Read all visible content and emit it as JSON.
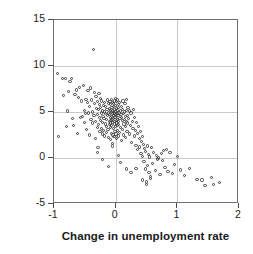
{
  "chart_data": {
    "type": "scatter",
    "title": "",
    "xlabel": "Change in unemployment rate",
    "ylabel": "GDP growth rate",
    "xlim": [
      -1,
      2
    ],
    "ylim": [
      -5,
      15
    ],
    "xticks": [
      -1,
      0,
      1,
      2
    ],
    "yticks": [
      -5,
      0,
      5,
      10,
      15
    ],
    "xticklabels": [
      "-1",
      "0",
      "1",
      "2"
    ],
    "yticklabels": [
      "-5",
      "0",
      "5",
      "10",
      "15"
    ],
    "grid": true,
    "legend": null,
    "marker": "open-circle",
    "marker_color": "#3a3a3a",
    "grid_color": "#c9c9c9",
    "frame_color": "#6e6e6e",
    "series": [
      {
        "name": "countries",
        "points": [
          [
            -0.94,
            9.2
          ],
          [
            -0.93,
            2.3
          ],
          [
            -0.86,
            8.6
          ],
          [
            -0.84,
            6.8
          ],
          [
            -0.82,
            8.6
          ],
          [
            -0.8,
            3.4
          ],
          [
            -0.78,
            5.1
          ],
          [
            -0.76,
            7.2
          ],
          [
            -0.74,
            8.3
          ],
          [
            -0.72,
            8.6
          ],
          [
            -0.7,
            4.3
          ],
          [
            -0.68,
            3.5
          ],
          [
            -0.66,
            6.9
          ],
          [
            -0.64,
            7.4
          ],
          [
            -0.62,
            2.7
          ],
          [
            -0.6,
            6.6
          ],
          [
            -0.58,
            7.7
          ],
          [
            -0.57,
            4.4
          ],
          [
            -0.56,
            6.2
          ],
          [
            -0.54,
            4.5
          ],
          [
            -0.52,
            7.9
          ],
          [
            -0.51,
            3.9
          ],
          [
            -0.5,
            5.2
          ],
          [
            -0.49,
            4.8
          ],
          [
            -0.48,
            6.4
          ],
          [
            -0.47,
            3.1
          ],
          [
            -0.46,
            6.0
          ],
          [
            -0.45,
            7.3
          ],
          [
            -0.44,
            4.9
          ],
          [
            -0.43,
            5.6
          ],
          [
            -0.42,
            2.5
          ],
          [
            -0.41,
            7.6
          ],
          [
            -0.4,
            4.2
          ],
          [
            -0.39,
            6.3
          ],
          [
            -0.38,
            5.0
          ],
          [
            -0.37,
            3.8
          ],
          [
            -0.36,
            11.8
          ],
          [
            -0.35,
            4.6
          ],
          [
            -0.345,
            7.1
          ],
          [
            -0.34,
            5.9
          ],
          [
            -0.33,
            2.1
          ],
          [
            -0.325,
            4.0
          ],
          [
            -0.32,
            6.7
          ],
          [
            -0.31,
            5.4
          ],
          [
            -0.3,
            3.3
          ],
          [
            -0.295,
            4.7
          ],
          [
            -0.29,
            6.1
          ],
          [
            -0.285,
            1.1
          ],
          [
            -0.28,
            5.3
          ],
          [
            -0.275,
            3.6
          ],
          [
            -0.27,
            7.0
          ],
          [
            -0.265,
            4.4
          ],
          [
            -0.26,
            5.8
          ],
          [
            -0.255,
            2.9
          ],
          [
            -0.25,
            6.5
          ],
          [
            -0.245,
            4.1
          ],
          [
            -0.24,
            5.5
          ],
          [
            -0.235,
            3.2
          ],
          [
            -0.23,
            4.9
          ],
          [
            -0.225,
            6.2
          ],
          [
            -0.22,
            2.6
          ],
          [
            -0.215,
            5.1
          ],
          [
            -0.21,
            3.9
          ],
          [
            -0.205,
            4.5
          ],
          [
            -0.2,
            5.7
          ],
          [
            -0.195,
            3.0
          ],
          [
            -0.19,
            4.3
          ],
          [
            -0.185,
            6.0
          ],
          [
            -0.18,
            2.4
          ],
          [
            -0.175,
            5.0
          ],
          [
            -0.17,
            3.7
          ],
          [
            -0.165,
            4.8
          ],
          [
            -0.16,
            5.6
          ],
          [
            -0.155,
            2.8
          ],
          [
            -0.15,
            4.2
          ],
          [
            -0.145,
            3.4
          ],
          [
            -0.14,
            5.3
          ],
          [
            -0.135,
            4.6
          ],
          [
            -0.13,
            6.3
          ],
          [
            -0.125,
            3.1
          ],
          [
            -0.12,
            4.9
          ],
          [
            -0.115,
            5.9
          ],
          [
            -0.11,
            2.2
          ],
          [
            -0.105,
            4.0
          ],
          [
            -0.1,
            5.4
          ],
          [
            -0.098,
            3.6
          ],
          [
            -0.095,
            4.7
          ],
          [
            -0.092,
            6.1
          ],
          [
            -0.09,
            2.0
          ],
          [
            -0.088,
            5.2
          ],
          [
            -0.085,
            3.8
          ],
          [
            -0.082,
            4.4
          ],
          [
            -0.08,
            5.8
          ],
          [
            -0.078,
            3.3
          ],
          [
            -0.075,
            4.1
          ],
          [
            -0.072,
            5.0
          ],
          [
            -0.07,
            6.4
          ],
          [
            -0.068,
            2.7
          ],
          [
            -0.065,
            4.5
          ],
          [
            -0.062,
            3.5
          ],
          [
            -0.06,
            5.5
          ],
          [
            -0.058,
            4.2
          ],
          [
            -0.055,
            1.6
          ],
          [
            -0.052,
            4.8
          ],
          [
            -0.05,
            3.9
          ],
          [
            -0.048,
            5.1
          ],
          [
            -0.045,
            6.0
          ],
          [
            -0.042,
            2.5
          ],
          [
            -0.04,
            4.3
          ],
          [
            -0.038,
            5.6
          ],
          [
            -0.035,
            3.2
          ],
          [
            -0.032,
            4.6
          ],
          [
            -0.03,
            5.9
          ],
          [
            -0.028,
            2.3
          ],
          [
            -0.025,
            4.0
          ],
          [
            -0.022,
            5.3
          ],
          [
            -0.02,
            3.7
          ],
          [
            -0.018,
            4.9
          ],
          [
            -0.015,
            6.2
          ],
          [
            -0.012,
            2.9
          ],
          [
            -0.01,
            4.4
          ],
          [
            -0.008,
            5.7
          ],
          [
            -0.005,
            3.4
          ],
          [
            -0.002,
            4.7
          ],
          [
            0.0,
            5.0
          ],
          [
            0.002,
            6.5
          ],
          [
            0.005,
            2.6
          ],
          [
            0.008,
            4.1
          ],
          [
            0.01,
            5.4
          ],
          [
            0.012,
            3.8
          ],
          [
            0.015,
            4.5
          ],
          [
            0.018,
            6.1
          ],
          [
            0.02,
            2.1
          ],
          [
            0.022,
            4.8
          ],
          [
            0.025,
            3.5
          ],
          [
            0.028,
            5.2
          ],
          [
            0.03,
            4.2
          ],
          [
            0.032,
            6.3
          ],
          [
            0.035,
            3.0
          ],
          [
            0.038,
            4.6
          ],
          [
            0.04,
            5.5
          ],
          [
            0.042,
            2.4
          ],
          [
            0.045,
            4.0
          ],
          [
            0.048,
            5.8
          ],
          [
            0.05,
            3.6
          ],
          [
            0.055,
            4.9
          ],
          [
            0.06,
            6.0
          ],
          [
            0.065,
            2.8
          ],
          [
            0.07,
            4.3
          ],
          [
            0.075,
            5.1
          ],
          [
            0.08,
            3.3
          ],
          [
            0.085,
            4.7
          ],
          [
            0.09,
            5.6
          ],
          [
            0.095,
            1.9
          ],
          [
            0.1,
            4.4
          ],
          [
            0.105,
            3.1
          ],
          [
            0.11,
            5.3
          ],
          [
            0.115,
            4.1
          ],
          [
            0.12,
            6.2
          ],
          [
            0.125,
            2.5
          ],
          [
            0.13,
            4.8
          ],
          [
            0.135,
            3.7
          ],
          [
            0.14,
            5.0
          ],
          [
            0.145,
            4.2
          ],
          [
            0.15,
            5.9
          ],
          [
            0.155,
            2.2
          ],
          [
            0.16,
            4.5
          ],
          [
            0.165,
            3.4
          ],
          [
            0.17,
            5.2
          ],
          [
            0.175,
            4.0
          ],
          [
            0.18,
            6.4
          ],
          [
            0.185,
            2.9
          ],
          [
            0.19,
            4.6
          ],
          [
            0.195,
            3.8
          ],
          [
            0.2,
            5.5
          ],
          [
            0.21,
            4.3
          ],
          [
            0.22,
            2.6
          ],
          [
            0.23,
            5.1
          ],
          [
            0.24,
            3.5
          ],
          [
            0.25,
            4.9
          ],
          [
            0.26,
            1.7
          ],
          [
            0.27,
            4.0
          ],
          [
            0.28,
            3.2
          ],
          [
            0.29,
            5.3
          ],
          [
            0.3,
            2.4
          ],
          [
            0.31,
            4.4
          ],
          [
            0.32,
            3.0
          ],
          [
            0.33,
            1.4
          ],
          [
            0.34,
            3.9
          ],
          [
            0.35,
            2.7
          ],
          [
            0.36,
            0.9
          ],
          [
            0.37,
            3.4
          ],
          [
            0.38,
            2.1
          ],
          [
            0.39,
            1.2
          ],
          [
            0.4,
            2.9
          ],
          [
            0.41,
            0.5
          ],
          [
            0.42,
            1.8
          ],
          [
            0.43,
            2.3
          ],
          [
            0.44,
            0.2
          ],
          [
            0.45,
            1.5
          ],
          [
            0.46,
            -0.4
          ],
          [
            0.47,
            1.0
          ],
          [
            0.48,
            -1.2
          ],
          [
            0.49,
            0.7
          ],
          [
            0.5,
            -2.9
          ],
          [
            0.51,
            1.3
          ],
          [
            0.52,
            -0.8
          ],
          [
            0.53,
            0.4
          ],
          [
            0.54,
            -1.6
          ],
          [
            0.55,
            0.1
          ],
          [
            0.57,
            -2.0
          ],
          [
            0.58,
            1.1
          ],
          [
            0.6,
            -0.6
          ],
          [
            0.62,
            0.6
          ],
          [
            0.64,
            -1.4
          ],
          [
            0.66,
            0.3
          ],
          [
            0.68,
            -0.1
          ],
          [
            0.7,
            0.0
          ],
          [
            0.72,
            -1.8
          ],
          [
            0.74,
            0.5
          ],
          [
            0.76,
            -0.3
          ],
          [
            0.78,
            0.8
          ],
          [
            0.8,
            -1.0
          ],
          [
            0.82,
            0.9
          ],
          [
            0.85,
            -1.5
          ],
          [
            0.88,
            0.6
          ],
          [
            0.92,
            -1.7
          ],
          [
            0.96,
            -0.7
          ],
          [
            1.0,
            0.2
          ],
          [
            1.05,
            -1.3
          ],
          [
            1.12,
            -1.9
          ],
          [
            1.2,
            -1.1
          ],
          [
            1.32,
            -2.3
          ],
          [
            1.4,
            -2.4
          ],
          [
            1.55,
            -2.1
          ],
          [
            1.58,
            -2.9
          ],
          [
            1.68,
            -2.7
          ],
          [
            1.45,
            -3.0
          ],
          [
            -0.3,
            0.6
          ],
          [
            -0.22,
            -0.2
          ],
          [
            -0.12,
            -0.9
          ],
          [
            0.08,
            -0.5
          ],
          [
            0.18,
            -1.2
          ],
          [
            0.05,
            0.3
          ],
          [
            -0.05,
            1.3
          ],
          [
            0.25,
            -1.6
          ],
          [
            0.33,
            -1.1
          ],
          [
            0.44,
            -2.4
          ],
          [
            0.5,
            -2.6
          ],
          [
            0.56,
            -2.2
          ]
        ]
      }
    ]
  }
}
